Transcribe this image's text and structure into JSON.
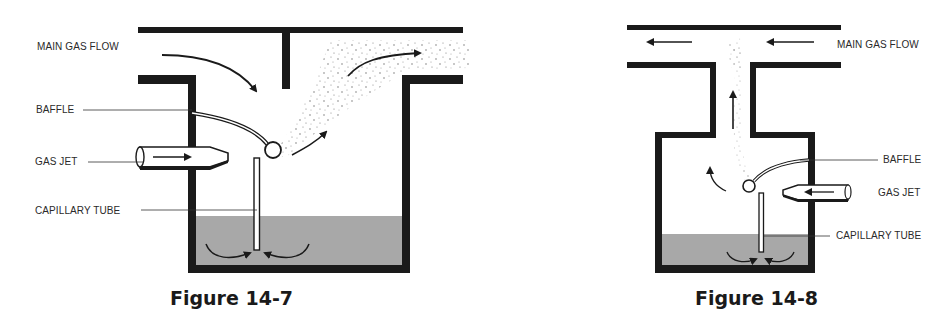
{
  "figures": [
    {
      "id": "fig-14-7",
      "caption": "Figure 14-7",
      "labels": {
        "main_gas_flow": "MAIN GAS FLOW",
        "baffle": "BAFFLE",
        "gas_jet": "GAS JET",
        "capillary_tube": "CAPILLARY TUBE"
      }
    },
    {
      "id": "fig-14-8",
      "caption": "Figure 14-8",
      "labels": {
        "main_gas_flow": "MAIN GAS FLOW",
        "baffle": "BAFFLE",
        "gas_jet": "GAS JET",
        "capillary_tube": "CAPILLARY TUBE"
      }
    }
  ],
  "colors": {
    "ink": "#1a1a1a",
    "liquid": "#a8a8a8",
    "background": "#ffffff"
  }
}
